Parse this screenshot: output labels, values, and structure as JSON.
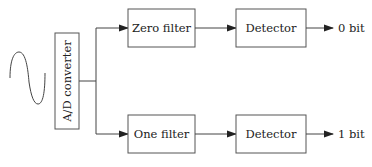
{
  "diagram": {
    "input_signal": "sine-wave",
    "converter": {
      "label": "A/D converter"
    },
    "branches": [
      {
        "filter": {
          "label": "Zero filter"
        },
        "detector": {
          "label": "Detector"
        },
        "output": {
          "label": "0 bit"
        }
      },
      {
        "filter": {
          "label": "One filter"
        },
        "detector": {
          "label": "Detector"
        },
        "output": {
          "label": "1 bit"
        }
      }
    ],
    "colors": {
      "stroke": "#555555",
      "text": "#222222",
      "background": "#ffffff"
    }
  }
}
